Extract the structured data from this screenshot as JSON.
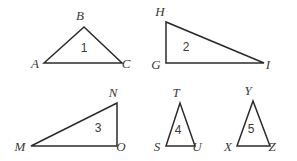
{
  "figure": {
    "type": "geometry-diagram",
    "stroke_color": "#2b2b2b",
    "label_color": "#3a3a3a",
    "background_color": "#ffffff",
    "triangles": [
      {
        "number": "1",
        "number_pos": {
          "x": 84,
          "y": 52
        },
        "shape": "acute",
        "points": "44,63 84,27 122,63",
        "vertices": [
          {
            "name": "A",
            "x": 35,
            "y": 68
          },
          {
            "name": "B",
            "x": 80,
            "y": 20
          },
          {
            "name": "C",
            "x": 126,
            "y": 68
          }
        ]
      },
      {
        "number": "2",
        "number_pos": {
          "x": 186,
          "y": 51
        },
        "shape": "right",
        "points": "166,22 166,63 264,63",
        "vertices": [
          {
            "name": "H",
            "x": 160,
            "y": 16
          },
          {
            "name": "G",
            "x": 156,
            "y": 69
          },
          {
            "name": "I",
            "x": 268,
            "y": 69
          }
        ]
      },
      {
        "number": "3",
        "number_pos": {
          "x": 98,
          "y": 132
        },
        "shape": "right",
        "points": "31,146 117,103 117,146",
        "vertices": [
          {
            "name": "M",
            "x": 20,
            "y": 151
          },
          {
            "name": "N",
            "x": 113,
            "y": 97
          },
          {
            "name": "O",
            "x": 121,
            "y": 151
          }
        ]
      },
      {
        "number": "4",
        "number_pos": {
          "x": 178,
          "y": 134
        },
        "shape": "isosceles",
        "points": "166,146 180,103 195,146",
        "vertices": [
          {
            "name": "T",
            "x": 176,
            "y": 97
          },
          {
            "name": "S",
            "x": 157,
            "y": 151
          },
          {
            "name": "U",
            "x": 197,
            "y": 151
          }
        ]
      },
      {
        "number": "5",
        "number_pos": {
          "x": 251,
          "y": 133
        },
        "shape": "isosceles",
        "points": "237,146 253,101 270,146",
        "vertices": [
          {
            "name": "Y",
            "x": 248,
            "y": 95
          },
          {
            "name": "X",
            "x": 228,
            "y": 151
          },
          {
            "name": "Z",
            "x": 272,
            "y": 151
          }
        ]
      }
    ]
  }
}
